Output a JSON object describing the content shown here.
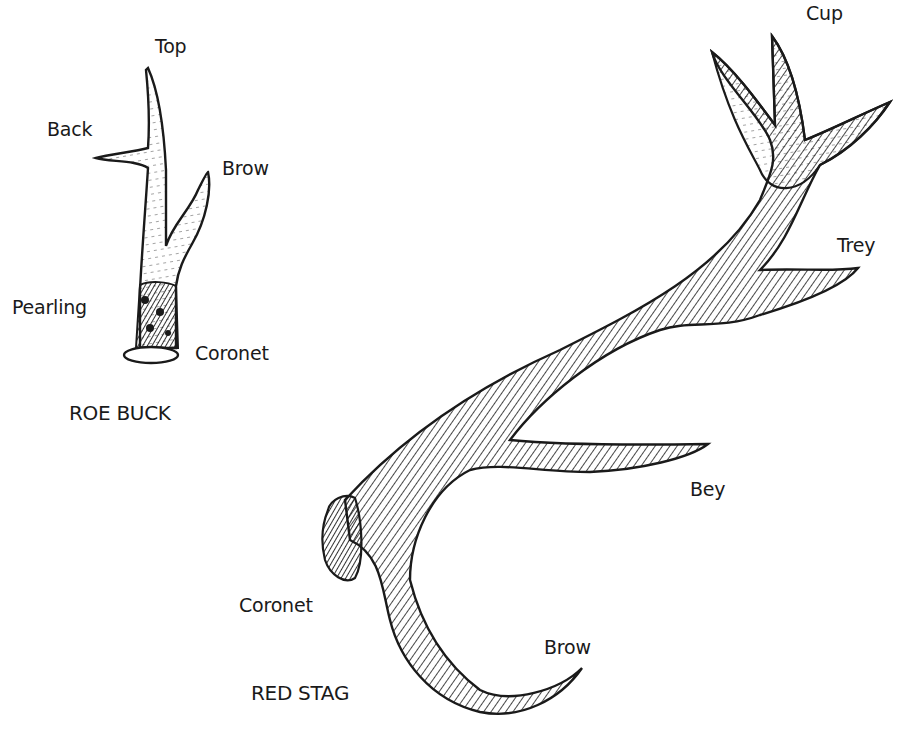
{
  "roe_buck": {
    "caption": "ROE BUCK",
    "labels": {
      "top": "Top",
      "back": "Back",
      "brow": "Brow",
      "pearling": "Pearling",
      "coronet": "Coronet"
    }
  },
  "red_stag": {
    "caption": "RED STAG",
    "labels": {
      "cup": "Cup",
      "trey": "Trey",
      "bey": "Bey",
      "coronet": "Coronet",
      "brow": "Brow"
    }
  },
  "colors": {
    "ink": "#1a1a1a",
    "background": "#ffffff"
  }
}
